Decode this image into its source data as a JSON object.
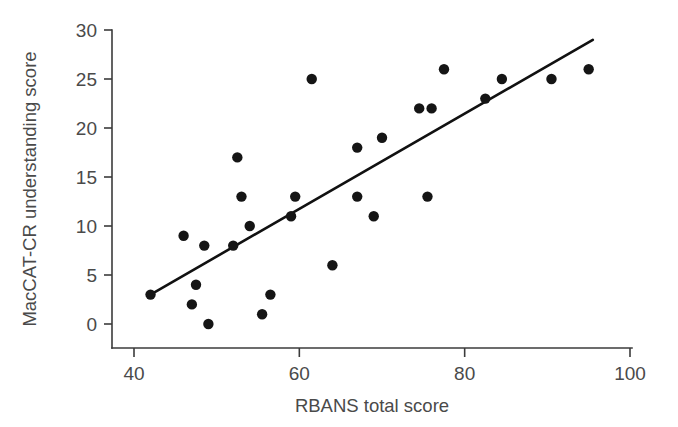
{
  "chart_data": {
    "type": "scatter",
    "title": "",
    "xlabel": "RBANS total score",
    "ylabel": "MacCAT-CR understanding score",
    "xlim": [
      36,
      100
    ],
    "ylim": [
      -2,
      31
    ],
    "xticks": [
      40,
      60,
      80,
      100
    ],
    "yticks": [
      0,
      5,
      10,
      15,
      20,
      25,
      30
    ],
    "grid": false,
    "legend": null,
    "marker": "filled-circle",
    "marker_color": "#151515",
    "points": [
      {
        "x": 42,
        "y": 3
      },
      {
        "x": 46,
        "y": 9
      },
      {
        "x": 47,
        "y": 2
      },
      {
        "x": 47.5,
        "y": 4
      },
      {
        "x": 48.5,
        "y": 8
      },
      {
        "x": 49,
        "y": 0
      },
      {
        "x": 52,
        "y": 8
      },
      {
        "x": 52.5,
        "y": 17
      },
      {
        "x": 53,
        "y": 13
      },
      {
        "x": 54,
        "y": 10
      },
      {
        "x": 55.5,
        "y": 1
      },
      {
        "x": 56.5,
        "y": 3
      },
      {
        "x": 59,
        "y": 11
      },
      {
        "x": 59.5,
        "y": 13
      },
      {
        "x": 61.5,
        "y": 25
      },
      {
        "x": 64,
        "y": 6
      },
      {
        "x": 67,
        "y": 13
      },
      {
        "x": 67,
        "y": 18
      },
      {
        "x": 69,
        "y": 11
      },
      {
        "x": 70,
        "y": 19
      },
      {
        "x": 74.5,
        "y": 22
      },
      {
        "x": 75.5,
        "y": 13
      },
      {
        "x": 76,
        "y": 22
      },
      {
        "x": 77.5,
        "y": 26
      },
      {
        "x": 82.5,
        "y": 23
      },
      {
        "x": 84.5,
        "y": 25
      },
      {
        "x": 90.5,
        "y": 25
      },
      {
        "x": 95,
        "y": 26
      }
    ],
    "trendline": {
      "type": "linear-fit",
      "x_start": 42,
      "y_start": 3,
      "x_end": 95.5,
      "y_end": 29,
      "color": "#111111"
    }
  },
  "axes": {
    "x_tick_labels": [
      "40",
      "60",
      "80",
      "100"
    ],
    "y_tick_labels": [
      "0",
      "5",
      "10",
      "15",
      "20",
      "25",
      "30"
    ],
    "x_axis_title": "RBANS total score",
    "y_axis_title": "MacCAT-CR understanding score"
  }
}
